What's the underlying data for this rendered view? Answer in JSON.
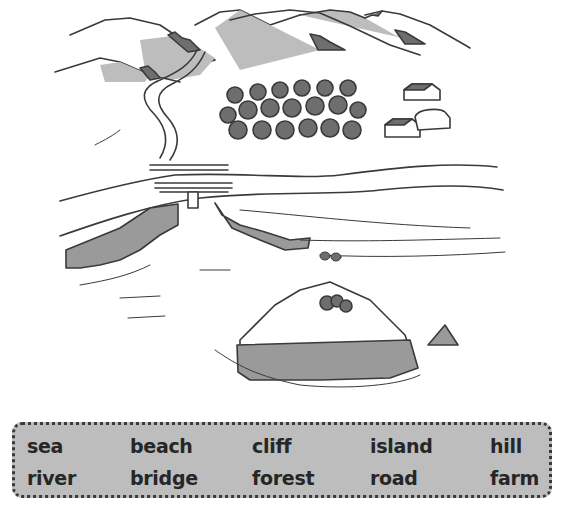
{
  "scene": {
    "description": "Illustrated landscape with mountains, river, forest, farm, road, bridge, cliffs, beach, sea and island",
    "labels_depicted": [
      "hills",
      "river",
      "forest",
      "farm",
      "road",
      "bridge",
      "cliff",
      "beach",
      "sea",
      "island"
    ]
  },
  "word_box": {
    "rows": [
      [
        "sea",
        "beach",
        "cliff",
        "island",
        "hill"
      ],
      [
        "river",
        "bridge",
        "forest",
        "road",
        "farm"
      ]
    ]
  },
  "colors": {
    "ink": "#3a3a3a",
    "shade": "#bdbdbd",
    "dark_fill": "#6e6e6e",
    "box_bg": "#bdbdbd"
  }
}
